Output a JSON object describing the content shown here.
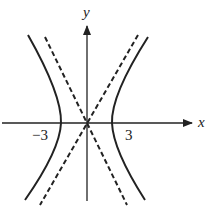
{
  "diagram": {
    "type": "hyperbola-with-asymptotes",
    "axes": {
      "x_label": "x",
      "y_label": "y"
    },
    "tick_labels": {
      "left_vertex": "−3",
      "right_vertex": "3"
    },
    "colors": {
      "ink": "#222222",
      "background": "#ffffff"
    }
  }
}
